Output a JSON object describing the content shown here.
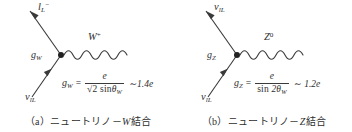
{
  "figure": {
    "background_color": "#ffffff",
    "ink_color": "#2e2e2e",
    "panels": [
      {
        "id": "a",
        "caption_tag": "（a）",
        "caption_text_pre": "ニュートリノ－",
        "caption_boson": "W",
        "caption_text_post": "結合",
        "outgoing_particle": {
          "symbol": "l",
          "subscript": "L",
          "superscript": "−"
        },
        "incoming_particle": {
          "symbol": "ν",
          "subscript": "lL",
          "superscript": ""
        },
        "boson": {
          "symbol": "W",
          "superscript": "+"
        },
        "coupling": {
          "symbol": "g",
          "subscript": "W"
        },
        "formula": {
          "lhs_symbol": "g",
          "lhs_subscript": "W",
          "equals": "=",
          "numerator": "e",
          "denominator_radical": "√2",
          "denominator_function": "sin",
          "denominator_angle": "θ",
          "denominator_angle_sub": "W",
          "approx_sign": "∼",
          "approx_value": "1.4e"
        }
      },
      {
        "id": "b",
        "caption_tag": "（b）",
        "caption_text_pre": "ニュートリノ－",
        "caption_boson": "Z",
        "caption_text_post": "結合",
        "outgoing_particle": {
          "symbol": "ν",
          "subscript": "lL",
          "superscript": ""
        },
        "incoming_particle": {
          "symbol": "ν",
          "subscript": "lL",
          "superscript": ""
        },
        "boson": {
          "symbol": "Z",
          "superscript": "0"
        },
        "coupling": {
          "symbol": "g",
          "subscript": "Z"
        },
        "formula": {
          "lhs_symbol": "g",
          "lhs_subscript": "Z",
          "equals": "=",
          "numerator": "e",
          "denominator_radical": "",
          "denominator_function": "sin",
          "denominator_angle": "2θ",
          "denominator_angle_sub": "W",
          "approx_sign": "∼",
          "approx_value": "1.2e"
        }
      }
    ]
  }
}
